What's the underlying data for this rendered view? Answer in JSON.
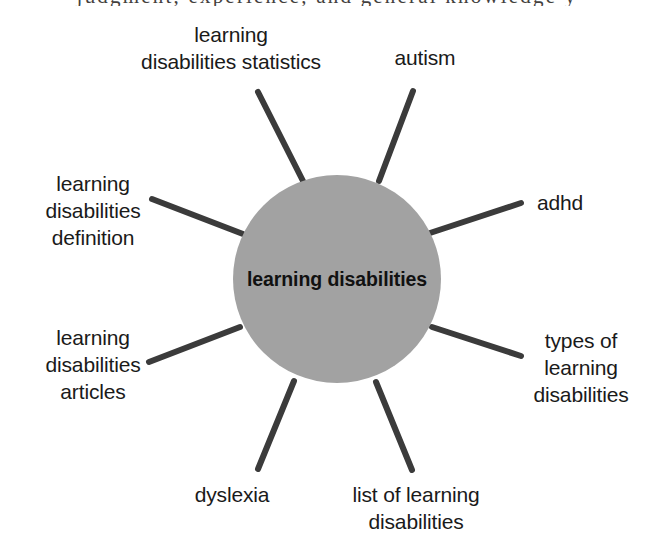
{
  "page": {
    "width": 654,
    "height": 551,
    "background_color": "#ffffff",
    "cut_off_line_above": "judgment, experience, and general knowledge y"
  },
  "diagram": {
    "type": "radial-hub-and-spoke keyword cluster",
    "hub": {
      "label": "learning\ndisabilities",
      "center_x": 337,
      "center_y": 279,
      "diameter": 208,
      "fill_color": "#a2a2a2",
      "text_color": "#111111"
    },
    "spoke_style": {
      "color": "#3b3b3b",
      "width": 6,
      "cap": "round",
      "count": 8
    },
    "nodes": [
      {
        "id": "learning-disabilities-statistics",
        "label": "learning\ndisabilities statistics",
        "angle_deg": 292,
        "label_left": 110,
        "label_top": 22,
        "label_width": 242,
        "spoke": {
          "x1": 303,
          "y1": 181,
          "x2": 258,
          "y2": 92
        }
      },
      {
        "id": "autism",
        "label": "autism",
        "angle_deg": 249,
        "label_left": 355,
        "label_top": 45,
        "label_width": 140,
        "spoke": {
          "x1": 379,
          "y1": 181,
          "x2": 413,
          "y2": 91
        }
      },
      {
        "id": "adhd",
        "label": "adhd",
        "angle_deg": 205,
        "label_left": 500,
        "label_top": 190,
        "label_width": 120,
        "spoke": {
          "x1": 430,
          "y1": 233,
          "x2": 521,
          "y2": 203
        }
      },
      {
        "id": "types-of-learning-disabilities",
        "label": "types of\nlearning\ndisabilities",
        "angle_deg": 155,
        "label_left": 508,
        "label_top": 328,
        "label_width": 146,
        "spoke": {
          "x1": 432,
          "y1": 327,
          "x2": 521,
          "y2": 356
        }
      },
      {
        "id": "list-of-learning-disabilities",
        "label": "list of learning\ndisabilities",
        "angle_deg": 112,
        "label_left": 310,
        "label_top": 482,
        "label_width": 212,
        "spoke": {
          "x1": 376,
          "y1": 382,
          "x2": 412,
          "y2": 470
        }
      },
      {
        "id": "dyslexia",
        "label": "dyslexia",
        "angle_deg": 68,
        "label_left": 152,
        "label_top": 482,
        "label_width": 160,
        "spoke": {
          "x1": 294,
          "y1": 381,
          "x2": 258,
          "y2": 469
        }
      },
      {
        "id": "learning-disabilities-articles",
        "label": "learning\ndisabilities\narticles",
        "angle_deg": 24,
        "label_left": 14,
        "label_top": 325,
        "label_width": 158,
        "spoke": {
          "x1": 240,
          "y1": 327,
          "x2": 149,
          "y2": 362
        }
      },
      {
        "id": "learning-disabilities-definition",
        "label": "learning\ndisabilities\ndefinition",
        "angle_deg": 335,
        "label_left": 14,
        "label_top": 171,
        "label_width": 158,
        "spoke": {
          "x1": 243,
          "y1": 234,
          "x2": 152,
          "y2": 199
        }
      }
    ]
  }
}
